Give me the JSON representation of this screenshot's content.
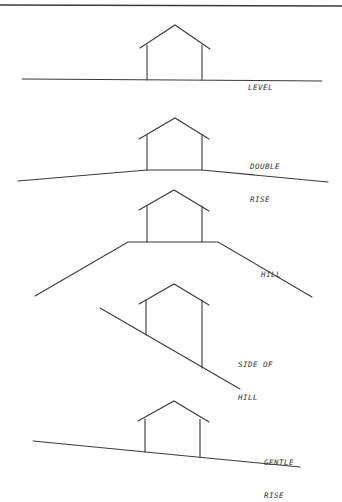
{
  "diagram": {
    "panels": [
      {
        "id": "level",
        "label_lines": [
          "LEVEL"
        ]
      },
      {
        "id": "double-rise",
        "label_lines": [
          "DOUBLE",
          "RISE"
        ]
      },
      {
        "id": "hill",
        "label_lines": [
          "HILL"
        ]
      },
      {
        "id": "side-of-hill",
        "label_lines": [
          "SIDE OF",
          "HILL"
        ]
      },
      {
        "id": "gentle-rise",
        "label_lines": [
          "GENTLE",
          "RISE"
        ]
      }
    ],
    "line_color": "#3a3a3a"
  }
}
